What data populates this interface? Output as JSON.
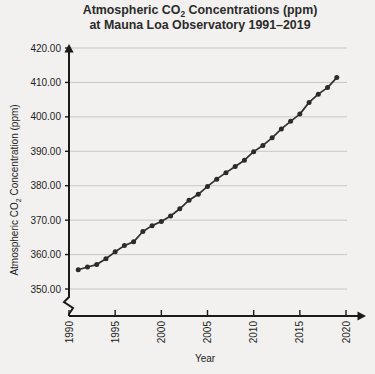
{
  "page": {
    "background_color": "#f2f1ef",
    "foreground_color": "#1e1e1e"
  },
  "chart_data": {
    "type": "line",
    "title": "Atmospheric CO2 Concentrations (ppm)",
    "title_line1_pre": "Atmospheric CO",
    "title_line1_sub": "2",
    "title_line1_post": " Concentrations (ppm)",
    "title_line2": "at Mauna Loa Observatory 1991–2019",
    "subtitle": "at Mauna Loa Observatory 1991–2019",
    "xlabel": "Year",
    "ylabel": "Atmospheric CO2 Concentration (ppm)",
    "ylabel_pre": "Atmospheric CO",
    "ylabel_sub": "2",
    "ylabel_post": " Concentration (ppm)",
    "xlim": [
      1990,
      2020
    ],
    "ylim": [
      350,
      420
    ],
    "y_axis_break": true,
    "grid": true,
    "grid_axis": "y",
    "legend": false,
    "legend_position": "none",
    "marker": "circle",
    "line_color": "#2f2f2f",
    "marker_color": "#2b2b2b",
    "grid_color": "#bdbdbd",
    "axis_color": "#1a1a1a",
    "xticks": [
      1990,
      1995,
      2000,
      2005,
      2010,
      2015,
      2020
    ],
    "xtick_labels": [
      "1990",
      "1995",
      "2000",
      "2005",
      "2010",
      "2015",
      "2020"
    ],
    "xtick_rotation": 90,
    "yticks": [
      350,
      360,
      370,
      380,
      390,
      400,
      410,
      420
    ],
    "ytick_labels": [
      "350.00",
      "360.00",
      "370.00",
      "380.00",
      "390.00",
      "400.00",
      "410.00",
      "420.00"
    ],
    "x": [
      1991,
      1992,
      1993,
      1994,
      1995,
      1996,
      1997,
      1998,
      1999,
      2000,
      2001,
      2002,
      2003,
      2004,
      2005,
      2006,
      2007,
      2008,
      2009,
      2010,
      2011,
      2012,
      2013,
      2014,
      2015,
      2016,
      2017,
      2018,
      2019
    ],
    "values": [
      355.6,
      356.4,
      357.1,
      358.8,
      360.8,
      362.6,
      363.7,
      366.7,
      368.4,
      369.6,
      371.2,
      373.3,
      375.8,
      377.5,
      379.8,
      381.9,
      383.8,
      385.6,
      387.4,
      389.9,
      391.7,
      393.9,
      396.5,
      398.7,
      400.8,
      404.2,
      406.6,
      408.5,
      411.4
    ],
    "series": [
      {
        "name": "Mauna Loa CO2",
        "values": [
          355.6,
          356.4,
          357.1,
          358.8,
          360.8,
          362.6,
          363.7,
          366.7,
          368.4,
          369.6,
          371.2,
          373.3,
          375.8,
          377.5,
          379.8,
          381.9,
          383.8,
          385.6,
          387.4,
          389.9,
          391.7,
          393.9,
          396.5,
          398.7,
          400.8,
          404.2,
          406.6,
          408.5,
          411.4
        ]
      }
    ]
  }
}
